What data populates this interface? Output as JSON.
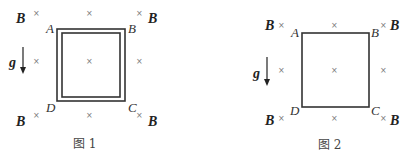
{
  "figures": [
    {
      "caption": "图 1",
      "field_label": "B",
      "gravity_label": "g",
      "vertices": {
        "A": "A",
        "B": "B",
        "C": "C",
        "D": "D"
      },
      "frame": "double-line square"
    },
    {
      "caption": "图 2",
      "field_label": "B",
      "gravity_label": "g",
      "vertices": {
        "A": "A",
        "B": "B",
        "C": "C",
        "D": "D"
      },
      "frame": "single-line square"
    }
  ],
  "cross_symbol": "×"
}
